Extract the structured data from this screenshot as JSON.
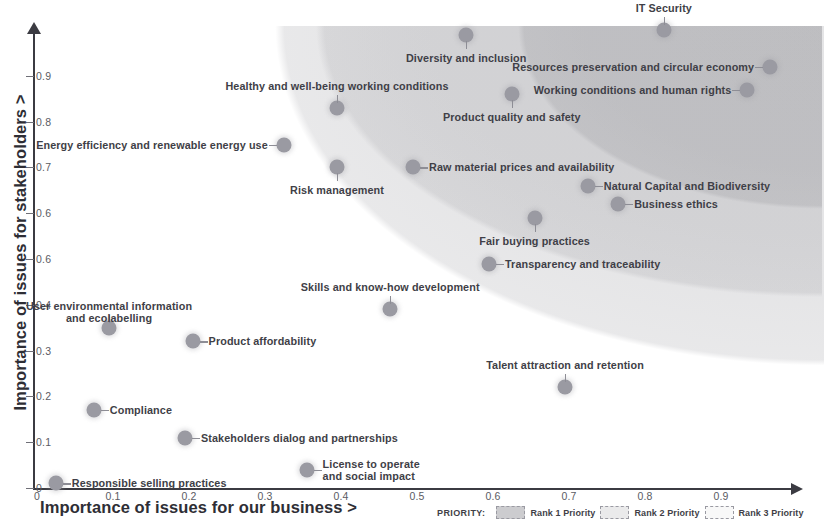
{
  "chart_data": {
    "type": "scatter",
    "title": "",
    "xlabel": "Importance of issues for our business >",
    "ylabel": "Importance of issues for stakeholders >",
    "xlim": [
      0,
      1.0
    ],
    "ylim": [
      0,
      1.0
    ],
    "grid": false,
    "xticks": [
      "0",
      "0.1",
      "0.2",
      "0.3",
      "0.4",
      "0.5",
      "0.6",
      "0.7",
      "0.8",
      "0.9"
    ],
    "yticks": [
      "0",
      "0.1",
      "0.2",
      "0.3",
      "0.4",
      "0.6",
      "0.6",
      "0.7",
      "0.8",
      "0.9"
    ],
    "legend_position": "bottom-right",
    "points": [
      {
        "label": "IT Security",
        "x": 0.83,
        "y": 1.0,
        "label_pos": "above"
      },
      {
        "label": "Diversity and inclusion",
        "x": 0.57,
        "y": 0.99,
        "label_pos": "below"
      },
      {
        "label": "Resources preservation and circular economy",
        "x": 0.97,
        "y": 0.92,
        "label_pos": "left"
      },
      {
        "label": "Working conditions and human rights",
        "x": 0.94,
        "y": 0.87,
        "label_pos": "left"
      },
      {
        "label": "Healthy and well-being working conditions",
        "x": 0.4,
        "y": 0.83,
        "label_pos": "above"
      },
      {
        "label": "Product quality and safety",
        "x": 0.63,
        "y": 0.86,
        "label_pos": "below"
      },
      {
        "label": "Energy efficiency and renewable energy use",
        "x": 0.33,
        "y": 0.75,
        "label_pos": "left"
      },
      {
        "label": "Raw material prices and availability",
        "x": 0.5,
        "y": 0.7,
        "label_pos": "right"
      },
      {
        "label": "Risk management",
        "x": 0.4,
        "y": 0.7,
        "label_pos": "below"
      },
      {
        "label": "Natural Capital and Biodiversity",
        "x": 0.73,
        "y": 0.66,
        "label_pos": "right"
      },
      {
        "label": "Business ethics",
        "x": 0.77,
        "y": 0.62,
        "label_pos": "right"
      },
      {
        "label": "Fair buying practices",
        "x": 0.66,
        "y": 0.59,
        "label_pos": "below"
      },
      {
        "label": "Transparency and traceability",
        "x": 0.6,
        "y": 0.49,
        "label_pos": "right"
      },
      {
        "label": "Skills and know-how development",
        "x": 0.47,
        "y": 0.39,
        "label_pos": "above"
      },
      {
        "label": "User environmental information\nand ecolabelling",
        "x": 0.1,
        "y": 0.35,
        "label_pos": "above"
      },
      {
        "label": "Product affordability",
        "x": 0.21,
        "y": 0.32,
        "label_pos": "right"
      },
      {
        "label": "Talent attraction and retention",
        "x": 0.7,
        "y": 0.22,
        "label_pos": "above"
      },
      {
        "label": "Compliance",
        "x": 0.08,
        "y": 0.17,
        "label_pos": "right"
      },
      {
        "label": "Stakeholders dialog and partnerships",
        "x": 0.2,
        "y": 0.11,
        "label_pos": "right"
      },
      {
        "label": "License to operate\nand social impact",
        "x": 0.36,
        "y": 0.04,
        "label_pos": "right"
      },
      {
        "label": "Responsible selling practices",
        "x": 0.03,
        "y": 0.01,
        "label_pos": "right"
      }
    ]
  },
  "legend": {
    "title": "PRIORITY:",
    "items": [
      {
        "label": "Rank 1 Priority",
        "color": "#808086"
      },
      {
        "label": "Rank 2 Priority",
        "color": "#8c8c92"
      },
      {
        "label": "Rank 3 Priority",
        "color": "#98989e"
      }
    ]
  },
  "colors": {
    "point": "#9a9aa2",
    "axis": "#3b3b42",
    "text": "#3f3f47"
  }
}
